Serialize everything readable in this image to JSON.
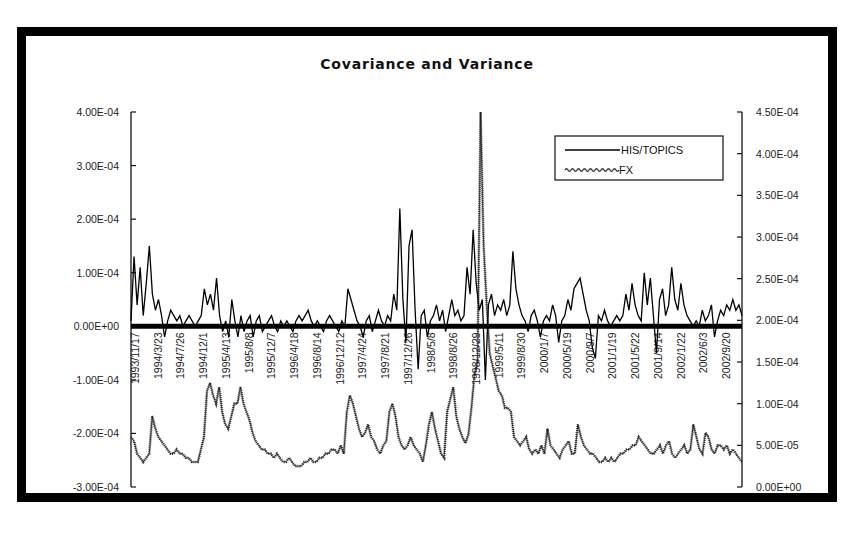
{
  "chart_data": {
    "type": "line",
    "title": "Covariance and Variance",
    "xlabel": "",
    "ylabel": "",
    "legend_position": "top-right",
    "grid": false,
    "left_axis": {
      "ylim": [
        -0.0003,
        0.0004
      ],
      "ticks": [
        0.0004,
        0.0003,
        0.0002,
        0.0001,
        0,
        -0.0001,
        -0.0002,
        -0.0003
      ],
      "tick_labels": [
        "4.00E-04",
        "3.00E-04",
        "2.00E-04",
        "1.00E-04",
        "0.00E+00",
        "-1.00E-04",
        "-2.00E-04",
        "-3.00E-04"
      ]
    },
    "right_axis": {
      "ylim": [
        0,
        0.00045
      ],
      "ticks": [
        0.00045,
        0.0004,
        0.00035,
        0.0003,
        0.00025,
        0.0002,
        0.00015,
        0.0001,
        5e-05,
        0
      ],
      "tick_labels": [
        "4.50E-04",
        "4.00E-04",
        "3.50E-04",
        "3.00E-04",
        "2.50E-04",
        "2.00E-04",
        "1.50E-04",
        "1.00E-04",
        "5.00E-05",
        "0.00E+00"
      ]
    },
    "x_tick_labels": [
      "1993/11/17",
      "1994/3/23",
      "1994/7/26",
      "1994/12/1",
      "1995/4/13",
      "1995/8/8",
      "1995/12/7",
      "1996/4/18",
      "1996/8/14",
      "1996/12/12",
      "1997/4/24",
      "1997/8/21",
      "1997/12/26",
      "1998/5/8",
      "1998/8/26",
      "1998/12/29",
      "1999/5/11",
      "1999/8/30",
      "2000/1/7",
      "2000/5/19",
      "2000/9/7",
      "2001/1/19",
      "2001/5/22",
      "2001/9/14",
      "2002/1/22",
      "2002/6/3",
      "2002/9/20"
    ],
    "series": [
      {
        "name": "HIS/TOPICS",
        "axis": "left",
        "style": "solid",
        "color": "#000000",
        "values": [
          1e-05,
          0.00013,
          4e-05,
          0.00011,
          2e-05,
          8e-05,
          0.00015,
          6e-05,
          3e-05,
          5e-05,
          2e-05,
          -2e-05,
          1e-05,
          3e-05,
          2e-05,
          1e-05,
          2e-05,
          0.0,
          1e-05,
          2e-05,
          1e-05,
          0.0,
          1e-05,
          2e-05,
          7e-05,
          4e-05,
          6e-05,
          3e-05,
          9e-05,
          2e-05,
          -1e-05,
          1e-05,
          -2e-05,
          5e-05,
          1e-05,
          -2e-05,
          2e-05,
          -1e-05,
          1e-05,
          2e-05,
          -2e-05,
          1e-05,
          2e-05,
          -1e-05,
          0.0,
          1e-05,
          2e-05,
          0.0,
          -1e-05,
          1e-05,
          0.0,
          1e-05,
          0.0,
          -1e-05,
          1e-05,
          2e-05,
          1e-05,
          2e-05,
          3e-05,
          1e-05,
          0.0,
          1e-05,
          0.0,
          -1e-05,
          1e-05,
          2e-05,
          1e-05,
          0.0,
          -1e-05,
          1e-05,
          0.0,
          7e-05,
          5e-05,
          3e-05,
          1e-05,
          0.0,
          -2e-05,
          1e-05,
          2e-05,
          -1e-05,
          1e-05,
          3e-05,
          1e-05,
          0.0,
          2e-05,
          1e-05,
          6e-05,
          3e-05,
          0.00022,
          5e-05,
          -3e-05,
          0.00015,
          0.00018,
          3e-05,
          -8e-05,
          2e-05,
          3e-05,
          -2e-05,
          1e-05,
          2e-05,
          4e-05,
          1e-05,
          3e-05,
          -1e-05,
          2e-05,
          5e-05,
          2e-05,
          3e-05,
          1e-05,
          2e-05,
          0.00011,
          6e-05,
          0.00018,
          8e-05,
          3e-05,
          5e-05,
          -0.0001,
          4e-05,
          6e-05,
          2e-05,
          4e-05,
          3e-05,
          5e-05,
          2e-05,
          4e-05,
          0.00014,
          7e-05,
          4e-05,
          2e-05,
          1e-05,
          -1e-05,
          2e-05,
          3e-05,
          1e-05,
          -2e-05,
          1e-05,
          2e-05,
          1e-05,
          4e-05,
          2e-05,
          -3e-05,
          1e-05,
          2e-05,
          5e-05,
          3e-05,
          7e-05,
          8e-05,
          9e-05,
          6e-05,
          3e-05,
          1e-05,
          -4e-05,
          -6e-05,
          2e-05,
          1e-05,
          3e-05,
          1e-05,
          0.0,
          1e-05,
          2e-05,
          1e-05,
          2e-05,
          6e-05,
          3e-05,
          8e-05,
          4e-05,
          2e-05,
          1e-05,
          0.0001,
          4e-05,
          9e-05,
          2e-05,
          -5e-05,
          5e-05,
          7e-05,
          2e-05,
          4e-05,
          0.00011,
          5e-05,
          3e-05,
          8e-05,
          4e-05,
          2e-05,
          1e-05,
          0.0,
          1e-05,
          0.0,
          3e-05,
          1e-05,
          2e-05,
          4e-05,
          -2e-05,
          1e-05,
          3e-05,
          2e-05,
          4e-05,
          3e-05,
          5e-05,
          3e-05,
          4e-05,
          2e-05
        ]
      },
      {
        "name": "FX",
        "axis": "right",
        "style": "dotted",
        "color": "#333333",
        "values": [
          6e-05,
          5.5e-05,
          4e-05,
          3.5e-05,
          3e-05,
          3.5e-05,
          4e-05,
          8.5e-05,
          7e-05,
          6e-05,
          5.5e-05,
          5e-05,
          4.5e-05,
          4e-05,
          4e-05,
          4.5e-05,
          4e-05,
          4e-05,
          3.5e-05,
          3.5e-05,
          3e-05,
          3e-05,
          3e-05,
          4.5e-05,
          6e-05,
          0.000115,
          0.000125,
          0.00011,
          0.0001,
          0.00012,
          9e-05,
          7.5e-05,
          7e-05,
          8.5e-05,
          0.0001,
          0.0001,
          0.00012,
          0.0001,
          9e-05,
          8e-05,
          6.5e-05,
          5.5e-05,
          5e-05,
          4.5e-05,
          4.5e-05,
          4e-05,
          4e-05,
          3.5e-05,
          4e-05,
          3.5e-05,
          3e-05,
          3e-05,
          3.5e-05,
          3e-05,
          2.5e-05,
          2.5e-05,
          2.5e-05,
          3e-05,
          3e-05,
          3.5e-05,
          3e-05,
          3e-05,
          3.5e-05,
          3.5e-05,
          4e-05,
          4e-05,
          4.5e-05,
          4.5e-05,
          4e-05,
          5e-05,
          4e-05,
          9e-05,
          0.00011,
          0.0001,
          8.5e-05,
          7e-05,
          6e-05,
          6.5e-05,
          7.5e-05,
          6e-05,
          5.5e-05,
          4.5e-05,
          4e-05,
          5e-05,
          5.5e-05,
          9e-05,
          0.0001,
          8.5e-05,
          6e-05,
          5e-05,
          4.5e-05,
          5e-05,
          6e-05,
          5e-05,
          4.5e-05,
          4e-05,
          3e-05,
          5e-05,
          7.5e-05,
          9e-05,
          7e-05,
          5.5e-05,
          4e-05,
          3.5e-05,
          9e-05,
          0.000105,
          0.00012,
          8.5e-05,
          7e-05,
          6e-05,
          5.25e-05,
          6.3e-05,
          9.5e-05,
          0.000135,
          0.00015,
          0.00045,
          0.00029,
          0.00022,
          0.00016,
          0.000145,
          0.00013,
          0.000115,
          0.00011,
          9.5e-05,
          9.5e-05,
          9e-05,
          6e-05,
          5.5e-05,
          5e-05,
          5.5e-05,
          6e-05,
          4.5e-05,
          4e-05,
          4.5e-05,
          4e-05,
          5e-05,
          4e-05,
          7e-05,
          5e-05,
          4.5e-05,
          4e-05,
          3.5e-05,
          4.5e-05,
          5e-05,
          5.5e-05,
          4e-05,
          4e-05,
          7.5e-05,
          6e-05,
          5e-05,
          4.5e-05,
          4e-05,
          4e-05,
          3.5e-05,
          3e-05,
          3e-05,
          3.5e-05,
          3e-05,
          3.5e-05,
          3e-05,
          3.5e-05,
          4e-05,
          4e-05,
          4.5e-05,
          4.5e-05,
          5e-05,
          5e-05,
          6e-05,
          5.5e-05,
          5e-05,
          4.5e-05,
          4e-05,
          4e-05,
          4.5e-05,
          5e-05,
          4e-05,
          5e-05,
          5.5e-05,
          4e-05,
          3.5e-05,
          4e-05,
          4.5e-05,
          5e-05,
          4e-05,
          4.5e-05,
          7.5e-05,
          6e-05,
          4.5e-05,
          4e-05,
          6.5e-05,
          6e-05,
          4.5e-05,
          4e-05,
          5e-05,
          5e-05,
          4.5e-05,
          5e-05,
          4e-05,
          4.5e-05,
          4e-05,
          3.5e-05,
          3e-05
        ]
      }
    ]
  }
}
